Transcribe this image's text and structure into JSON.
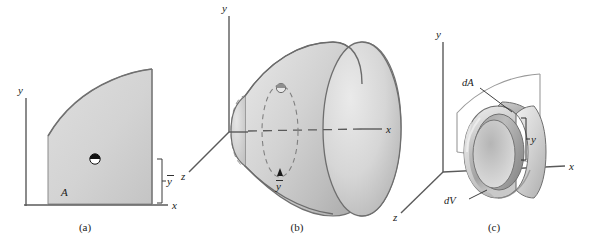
{
  "figure": {
    "type": "technical-illustration",
    "panels": [
      {
        "id": "a",
        "caption": "(a)",
        "axes": [
          {
            "name": "y-axis",
            "label": "y"
          },
          {
            "name": "x-axis",
            "label": "x"
          }
        ],
        "labels": [
          {
            "name": "area-label",
            "text": "A"
          },
          {
            "name": "centroid-height-label",
            "text": "y"
          }
        ],
        "markers": [
          {
            "name": "centroid-marker",
            "kind": "quadrant-circle"
          }
        ]
      },
      {
        "id": "b",
        "caption": "(b)",
        "axes": [
          {
            "name": "y-axis",
            "label": "y"
          },
          {
            "name": "x-axis",
            "label": "x"
          },
          {
            "name": "z-axis",
            "label": "z"
          }
        ],
        "labels": [
          {
            "name": "centroid-radius-label",
            "text": "y"
          }
        ],
        "markers": [
          {
            "name": "centroid-marker",
            "kind": "quadrant-circle"
          },
          {
            "name": "centroid-path-ellipse",
            "kind": "dashed-ellipse"
          }
        ]
      },
      {
        "id": "c",
        "caption": "(c)",
        "axes": [
          {
            "name": "y-axis",
            "label": "y"
          },
          {
            "name": "x-axis",
            "label": "x"
          },
          {
            "name": "z-axis",
            "label": "z"
          }
        ],
        "labels": [
          {
            "name": "area-element-label",
            "text": "dA"
          },
          {
            "name": "volume-element-label",
            "text": "dV"
          },
          {
            "name": "ring-radius-label",
            "text": "y"
          }
        ]
      }
    ],
    "colors": {
      "fill_light": "#d9d9d9",
      "fill_mid": "#c6c6c6",
      "fill_dark": "#ababab",
      "fill_shadow": "#9a9a9a",
      "outline": "#6e6e6e",
      "axis": "#5a5a5a",
      "text": "#1a1a1a",
      "background": "#ffffff"
    }
  }
}
